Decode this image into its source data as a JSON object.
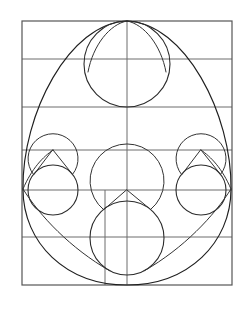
{
  "figure": {
    "title": "Geometric egg construction diagram",
    "background_color": "#ffffff",
    "frame_color": "#555555",
    "grid_color": "#6d6d6d",
    "curve_color": "#1f1f1f",
    "canvas": {
      "width": 248,
      "height": 309
    },
    "frame": {
      "left": 22,
      "top": 21,
      "right": 232,
      "bottom": 285,
      "width": 210,
      "height": 264
    },
    "guides": {
      "horizontal_y": [
        21,
        59,
        107,
        150,
        190,
        237,
        285
      ],
      "vertical_x": [
        22,
        105,
        127,
        232
      ],
      "centre_x": 127
    },
    "circles": [
      {
        "name": "upper-circle",
        "cx": 127,
        "cy": 64,
        "r": 43
      },
      {
        "name": "lower-left-circle",
        "cx": 53,
        "cy": 190,
        "r": 25
      },
      {
        "name": "lower-right-circle",
        "cx": 201,
        "cy": 190,
        "r": 25
      },
      {
        "name": "lower-centre-circle",
        "cx": 127,
        "cy": 238,
        "r": 37
      }
    ],
    "teardrops": [
      {
        "name": "upper-teardrop",
        "apex_x": 127,
        "apex_y": 21,
        "cx": 127,
        "cy": 64,
        "r": 43
      },
      {
        "name": "lower-left-teardrop",
        "apex_x": 53,
        "apex_y": 150,
        "cx": 53,
        "cy": 190,
        "r": 25
      },
      {
        "name": "lower-right-teardrop",
        "apex_x": 201,
        "apex_y": 150,
        "cx": 201,
        "cy": 190,
        "r": 25
      },
      {
        "name": "lower-centre-teardrop",
        "apex_x": 127,
        "apex_y": 190,
        "cx": 127,
        "cy": 238,
        "r": 37
      }
    ],
    "egg_outline": {
      "name": "large-ovoid",
      "apex_x": 127,
      "apex_y": 21,
      "waist_y": 190,
      "left_x": 22,
      "right_x": 232,
      "bottom_y": 285
    }
  }
}
